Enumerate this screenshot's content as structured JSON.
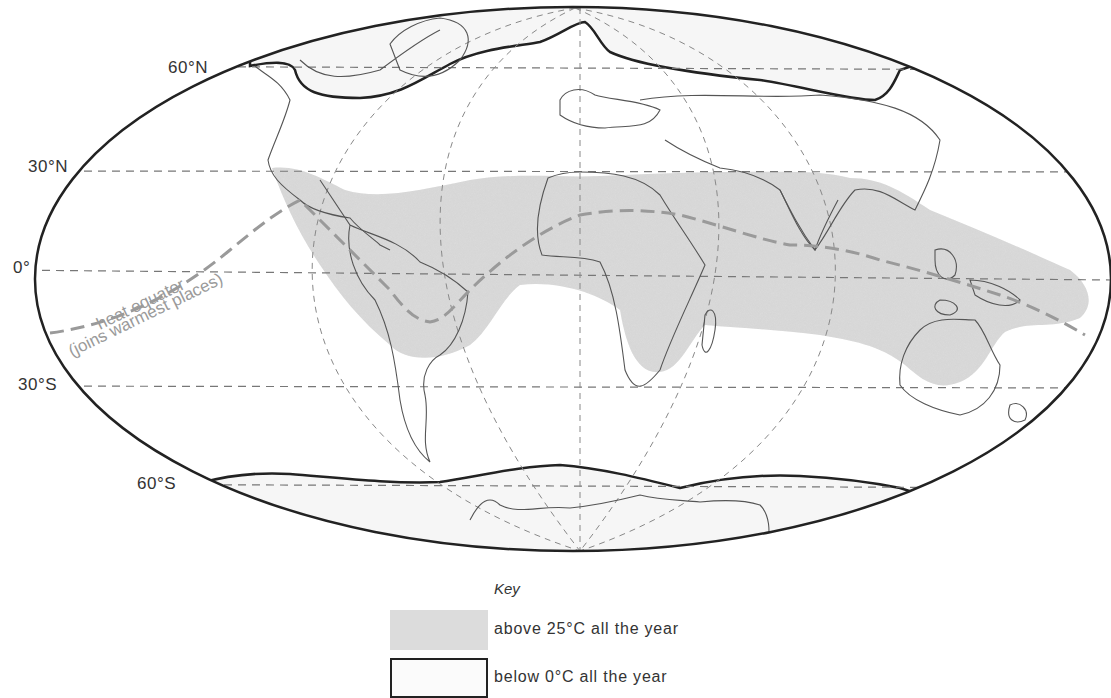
{
  "map": {
    "projection": "Mollweide-style oval world map",
    "latitude_labels": [
      {
        "id": "lat-60n",
        "text": "60°N"
      },
      {
        "id": "lat-30n",
        "text": "30°N"
      },
      {
        "id": "lat-0",
        "text": "0°"
      },
      {
        "id": "lat-30s",
        "text": "30°S"
      },
      {
        "id": "lat-60s",
        "text": "60°S"
      }
    ],
    "annotations": {
      "heat_equator_line1": "heat equator",
      "heat_equator_line2": "(joins warmest places)"
    },
    "colors": {
      "hot_fill": "#dcdcdc",
      "outline": "#222222",
      "coast": "#555555",
      "grid": "#777777",
      "heat_equator": "#9a9a9a"
    }
  },
  "legend": {
    "title": "Key",
    "items": [
      {
        "id": "hot",
        "label": "above 25°C all the year"
      },
      {
        "id": "cold",
        "label": "below 0°C all the year"
      }
    ]
  }
}
